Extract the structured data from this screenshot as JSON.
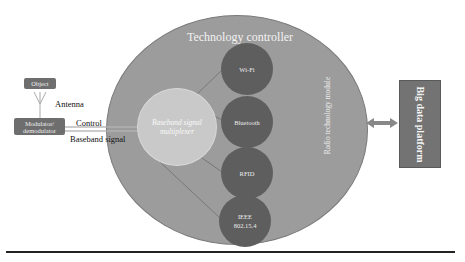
{
  "diagram": {
    "title": "Technology controller",
    "inner_circle": "Baseband signal multiplexer",
    "module_label": "Radio technology module",
    "nodes": [
      {
        "label": "Wi-Fi"
      },
      {
        "label": "Bluetooth"
      },
      {
        "label": "RFID"
      },
      {
        "label": "IEEE 802.15.4"
      }
    ],
    "platform": "Big data platform",
    "left": {
      "object": "Object",
      "antenna": "Antenna",
      "modulator": "Modulator/ demodulator",
      "control": "Control",
      "baseband": "Baseband signal"
    }
  },
  "colors": {
    "outer_circle": "#9c9c9c",
    "inner_circle": "#c9c9c9",
    "nodes": "#5e5e5e",
    "platform": "#737373"
  }
}
